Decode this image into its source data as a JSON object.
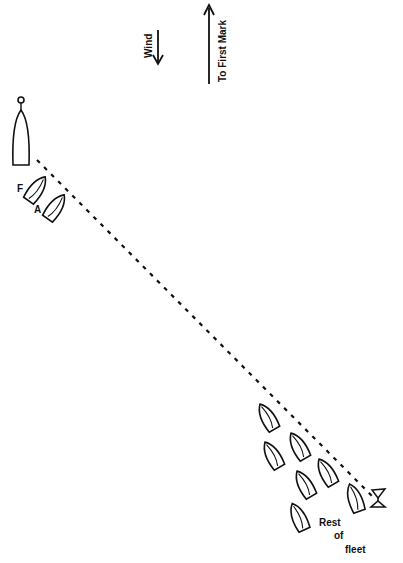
{
  "diagram": {
    "type": "sailing-race-start",
    "labels": {
      "wind": "Wind",
      "first_mark": "To First Mark",
      "boat_f": "F",
      "boat_a": "A",
      "rest_line1": "Rest",
      "rest_line2": "of",
      "rest_line3": "fleet"
    },
    "elements": {
      "committee_boat": "committee-boat",
      "start_line": "dashed-start-line",
      "pin_buoy": "pin-end-flag",
      "fleet_count": 7
    },
    "colors": {
      "ink": "#111111",
      "background": "#ffffff"
    }
  }
}
